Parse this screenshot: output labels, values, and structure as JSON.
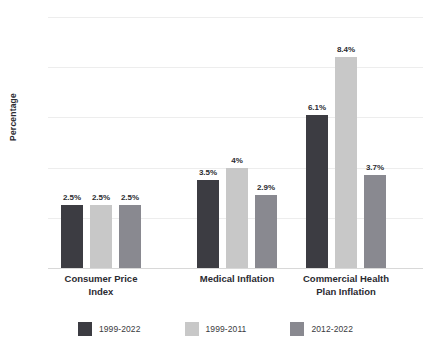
{
  "chart_data": {
    "type": "bar",
    "title": "",
    "xlabel": "",
    "ylabel": "Percentage",
    "ylim": [
      0,
      10
    ],
    "ytick_labels": [
      "0%",
      "2%",
      "4%",
      "6%",
      "8%",
      "10%"
    ],
    "ytick_values": [
      0,
      2,
      4,
      6,
      8,
      10
    ],
    "grid": true,
    "legend_position": "bottom",
    "categories": [
      "Consumer Price\nIndex",
      "Medical Inflation",
      "Commercial Health\nPlan Inflation"
    ],
    "series": [
      {
        "name": "1999-2022",
        "color": "#3c3c42",
        "values": [
          2.5,
          3.5,
          6.1
        ],
        "labels": [
          "2.5%",
          "3.5%",
          "6.1%"
        ]
      },
      {
        "name": "1999-2011",
        "color": "#c8c8c8",
        "values": [
          2.5,
          4.0,
          8.4
        ],
        "labels": [
          "2.5%",
          "4%",
          "8.4%"
        ]
      },
      {
        "name": "2012-2022",
        "color": "#898990",
        "values": [
          2.5,
          2.9,
          3.7
        ],
        "labels": [
          "2.5%",
          "2.9%",
          "3.7%"
        ]
      }
    ]
  },
  "colors": {
    "gridline": "#ededed",
    "axis": "#d8d8d8",
    "text_dark": "#2b2b31",
    "text_muted": "#6e6e74",
    "background": "#ffffff"
  }
}
